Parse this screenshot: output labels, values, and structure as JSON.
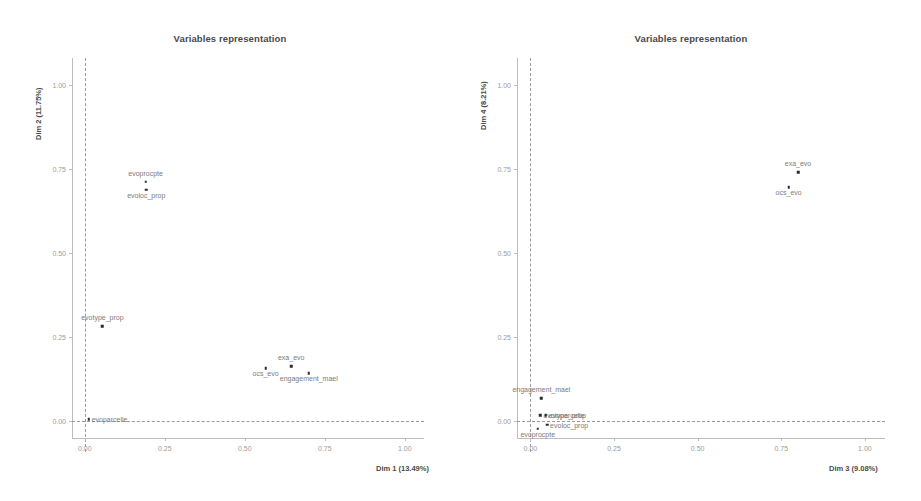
{
  "figure": {
    "width": 921,
    "height": 501,
    "background": "#ffffff",
    "point_color": "#2b2b2b",
    "label_color": "#7b7b7b",
    "axis_color": "#bdbdbd"
  },
  "chart_data": [
    {
      "type": "scatter",
      "title": "Variables representation",
      "xlabel": "Dim 1 (13.49%)",
      "ylabel": "Dim 2 (11.75%)",
      "xlim": [
        -0.04,
        1.06
      ],
      "ylim": [
        -0.05,
        1.08
      ],
      "xticks": [
        "0.00",
        "0.25",
        "0.50",
        "0.75",
        "1.00"
      ],
      "xtick_values": [
        0.0,
        0.25,
        0.5,
        0.75,
        1.0
      ],
      "yticks": [
        "0.00",
        "0.25",
        "0.50",
        "0.75",
        "1.00"
      ],
      "ytick_values": [
        0.0,
        0.25,
        0.5,
        0.75,
        1.0
      ],
      "grid": false,
      "reference_lines": {
        "vertical_x": 0.0,
        "horizontal_y": 0.0,
        "style": "dashed"
      },
      "legend": "none",
      "points": [
        {
          "label": "evoprocpte",
          "x": 0.19,
          "y": 0.712,
          "label_pos": "above"
        },
        {
          "label": "evoloc_prop",
          "x": 0.192,
          "y": 0.688,
          "label_pos": "below"
        },
        {
          "label": "evotype_prop",
          "x": 0.055,
          "y": 0.283,
          "label_pos": "above"
        },
        {
          "label": "evoparcelle",
          "x": 0.012,
          "y": 0.006,
          "label_pos": "right"
        },
        {
          "label": "ocs_evo",
          "x": 0.565,
          "y": 0.157,
          "label_pos": "below"
        },
        {
          "label": "exa_evo",
          "x": 0.645,
          "y": 0.163,
          "label_pos": "above"
        },
        {
          "label": "engagement_mael",
          "x": 0.7,
          "y": 0.143,
          "label_pos": "below"
        }
      ]
    },
    {
      "type": "scatter",
      "title": "Variables representation",
      "xlabel": "Dim 3 (9.08%)",
      "ylabel": "Dim 4 (8.21%)",
      "xlim": [
        -0.04,
        1.06
      ],
      "ylim": [
        -0.05,
        1.08
      ],
      "xticks": [
        "0.00",
        "0.25",
        "0.50",
        "0.75",
        "1.00"
      ],
      "xtick_values": [
        0.0,
        0.25,
        0.5,
        0.75,
        1.0
      ],
      "yticks": [
        "0.00",
        "0.25",
        "0.50",
        "0.75",
        "1.00"
      ],
      "ytick_values": [
        0.0,
        0.25,
        0.5,
        0.75,
        1.0
      ],
      "grid": false,
      "reference_lines": {
        "vertical_x": 0.0,
        "horizontal_y": 0.0,
        "style": "dashed"
      },
      "legend": "none",
      "points": [
        {
          "label": "exa_evo",
          "x": 0.8,
          "y": 0.74,
          "label_pos": "above"
        },
        {
          "label": "ocs_evo",
          "x": 0.772,
          "y": 0.695,
          "label_pos": "below"
        },
        {
          "label": "engagement_mael",
          "x": 0.033,
          "y": 0.068,
          "label_pos": "above"
        },
        {
          "label": "evotype_prop",
          "x": 0.03,
          "y": 0.018,
          "label_pos": "right"
        },
        {
          "label": "evoparcelle",
          "x": 0.046,
          "y": 0.018,
          "label_pos": "right"
        },
        {
          "label": "evoloc_prop",
          "x": 0.05,
          "y": -0.01,
          "label_pos": "right"
        },
        {
          "label": "evoprocpte",
          "x": 0.022,
          "y": -0.022,
          "label_pos": "below"
        }
      ]
    }
  ]
}
